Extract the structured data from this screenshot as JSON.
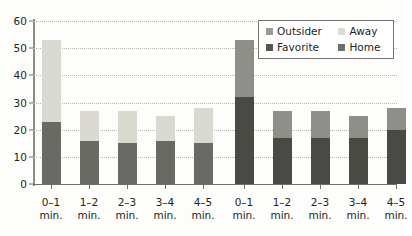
{
  "chart_data": {
    "type": "bar",
    "title": "",
    "subtitle": "",
    "xlabel": "",
    "ylabel": "",
    "ylim": [
      0,
      60
    ],
    "yticks": [
      0,
      10,
      20,
      30,
      40,
      50,
      60
    ],
    "grid": true,
    "stacked": true,
    "legend_position": "top-right",
    "groups": [
      {
        "name": "left-group",
        "categories": [
          "0–1\nmin.",
          "1–2\nmin.",
          "2–3\nmin.",
          "3–4\nmin.",
          "4–5\nmin."
        ],
        "series": [
          {
            "name": "Favorite",
            "values": [
              23,
              16,
              15,
              16,
              15
            ]
          },
          {
            "name": "Away",
            "values": [
              30,
              11,
              12,
              9,
              13
            ]
          }
        ],
        "totals": [
          53,
          27,
          27,
          25,
          28
        ]
      },
      {
        "name": "right-group",
        "categories": [
          "0–1\nmin.",
          "1–2\nmin.",
          "2–3\nmin.",
          "3–4\nmin.",
          "4–5\nmin."
        ],
        "series": [
          {
            "name": "Home",
            "values": [
              32,
              17,
              17,
              17,
              20
            ]
          },
          {
            "name": "Outsider",
            "values": [
              21,
              10,
              10,
              8,
              8
            ]
          }
        ],
        "totals": [
          53,
          27,
          27,
          25,
          28
        ]
      }
    ],
    "legend": [
      {
        "label": "Outsider",
        "color": "#9a9a95"
      },
      {
        "label": "Away",
        "color": "#dcdcd4"
      },
      {
        "label": "Favorite",
        "color": "#565651"
      },
      {
        "label": "Home",
        "color": "#6e6e68"
      }
    ]
  },
  "axis": {
    "y_tick_labels": [
      "0",
      "10",
      "20",
      "30",
      "40",
      "50",
      "60"
    ],
    "x_tick_labels_left": [
      {
        "range": "0–1",
        "unit": "min."
      },
      {
        "range": "1–2",
        "unit": "min."
      },
      {
        "range": "2–3",
        "unit": "min."
      },
      {
        "range": "3–4",
        "unit": "min."
      },
      {
        "range": "4–5",
        "unit": "min."
      }
    ],
    "x_tick_labels_right": [
      {
        "range": "0–1",
        "unit": "min."
      },
      {
        "range": "1–2",
        "unit": "min."
      },
      {
        "range": "2–3",
        "unit": "min."
      },
      {
        "range": "3–4",
        "unit": "min."
      },
      {
        "range": "4–5",
        "unit": "min."
      }
    ]
  },
  "legend_box": {
    "entries": [
      {
        "label": "Outsider",
        "color": "#9a9a95"
      },
      {
        "label": "Away",
        "color": "#dcdcd4"
      },
      {
        "label": "Favorite",
        "color": "#565651"
      },
      {
        "label": "Home",
        "color": "#6e6e68"
      }
    ]
  },
  "colors": {
    "bar_favorite": "#6a6a64",
    "bar_away": "#d9d9d1",
    "bar_home": "#4a4a45",
    "bar_outsider": "#8f8f8a",
    "axis": "#6f6d68",
    "grid": "#b9b6ad",
    "text": "#231f20",
    "background": "#fdfdfc"
  }
}
